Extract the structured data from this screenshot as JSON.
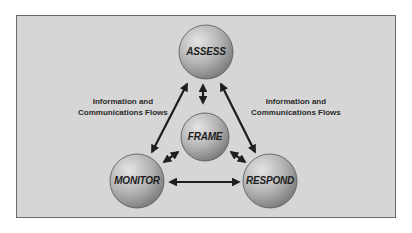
{
  "diagram": {
    "type": "cycle",
    "nodes": [
      {
        "id": "assess",
        "label": "ASSESS"
      },
      {
        "id": "frame",
        "label": "FRAME"
      },
      {
        "id": "monitor",
        "label": "MONITOR"
      },
      {
        "id": "respond",
        "label": "RESPOND"
      }
    ],
    "edges": [
      {
        "from": "assess",
        "to": "monitor",
        "bidirectional": true
      },
      {
        "from": "assess",
        "to": "respond",
        "bidirectional": true
      },
      {
        "from": "monitor",
        "to": "respond",
        "bidirectional": true
      },
      {
        "from": "frame",
        "to": "assess",
        "bidirectional": true
      },
      {
        "from": "frame",
        "to": "monitor",
        "bidirectional": true
      },
      {
        "from": "frame",
        "to": "respond",
        "bidirectional": true
      }
    ],
    "annotations": {
      "left": {
        "line1": "Information and",
        "line2": "Communications Flows"
      },
      "right": {
        "line1": "Information and",
        "line2": "Communications Flows"
      }
    },
    "colors": {
      "background": "#d6d6d6",
      "border": "#6a6a6a",
      "node_fill": "#a9a9a9",
      "arrow": "#1e1e1e"
    }
  }
}
